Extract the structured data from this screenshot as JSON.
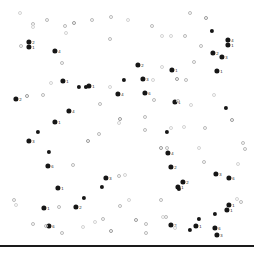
{
  "figure": {
    "title": "",
    "background_color": "#ffffff",
    "width": 254,
    "height": 254
  },
  "colors": {
    "filled_marker": "#161616",
    "hollow_marker": "#b9b9b9",
    "faint_marker": "#d3d3d3",
    "label_text": "#1d1d1d",
    "baseline": "#1a1a1a"
  },
  "baseline": {
    "name": "bottom-rule",
    "y": 245,
    "thickness": 1.6
  },
  "chart_data": {
    "type": "scatter",
    "title": "",
    "xlabel": "",
    "ylabel": "",
    "xlim": [
      0,
      254
    ],
    "ylim": [
      0,
      254
    ],
    "grid": false,
    "legend": null,
    "axes_visible": false,
    "series": [
      {
        "name": "labelled-points",
        "marker": "filled-circle",
        "color": "#161616",
        "points": [
          {
            "x": 29,
            "y": 42,
            "label": "2"
          },
          {
            "x": 29,
            "y": 47,
            "label": "1"
          },
          {
            "x": 55,
            "y": 51,
            "label": "4"
          },
          {
            "x": 63,
            "y": 81,
            "label": "1"
          },
          {
            "x": 79,
            "y": 87,
            "label": ""
          },
          {
            "x": 86,
            "y": 87,
            "label": ""
          },
          {
            "x": 89,
            "y": 86,
            "label": "1"
          },
          {
            "x": 16,
            "y": 99,
            "label": "2"
          },
          {
            "x": 118,
            "y": 94,
            "label": "4"
          },
          {
            "x": 69,
            "y": 111,
            "label": "4"
          },
          {
            "x": 55,
            "y": 122,
            "label": "1"
          },
          {
            "x": 138,
            "y": 65,
            "label": "2"
          },
          {
            "x": 124,
            "y": 80,
            "label": ""
          },
          {
            "x": 143,
            "y": 79,
            "label": "3"
          },
          {
            "x": 145,
            "y": 93,
            "label": "6"
          },
          {
            "x": 172,
            "y": 70,
            "label": "1"
          },
          {
            "x": 175,
            "y": 102,
            "label": "1"
          },
          {
            "x": 212,
            "y": 31,
            "label": ""
          },
          {
            "x": 228,
            "y": 40,
            "label": "4"
          },
          {
            "x": 228,
            "y": 45,
            "label": "1"
          },
          {
            "x": 213,
            "y": 53,
            "label": "2"
          },
          {
            "x": 222,
            "y": 57,
            "label": "3"
          },
          {
            "x": 217,
            "y": 71,
            "label": "1"
          },
          {
            "x": 226,
            "y": 108,
            "label": ""
          },
          {
            "x": 38,
            "y": 132,
            "label": ""
          },
          {
            "x": 29,
            "y": 141,
            "label": "3"
          },
          {
            "x": 49,
            "y": 152,
            "label": ""
          },
          {
            "x": 48,
            "y": 166,
            "label": "6"
          },
          {
            "x": 58,
            "y": 188,
            "label": "1"
          },
          {
            "x": 106,
            "y": 178,
            "label": "3"
          },
          {
            "x": 102,
            "y": 187,
            "label": ""
          },
          {
            "x": 44,
            "y": 208,
            "label": "1"
          },
          {
            "x": 76,
            "y": 207,
            "label": "2"
          },
          {
            "x": 84,
            "y": 198,
            "label": ""
          },
          {
            "x": 49,
            "y": 226,
            "label": "6"
          },
          {
            "x": 168,
            "y": 153,
            "label": "4"
          },
          {
            "x": 167,
            "y": 132,
            "label": ""
          },
          {
            "x": 183,
            "y": 182,
            "label": "2"
          },
          {
            "x": 216,
            "y": 174,
            "label": "3"
          },
          {
            "x": 229,
            "y": 178,
            "label": "6"
          },
          {
            "x": 171,
            "y": 167,
            "label": "2"
          },
          {
            "x": 178,
            "y": 187,
            "label": "1"
          },
          {
            "x": 179,
            "y": 189,
            "label": ""
          },
          {
            "x": 229,
            "y": 205,
            "label": "1"
          },
          {
            "x": 227,
            "y": 210,
            "label": "1"
          },
          {
            "x": 215,
            "y": 214,
            "label": ""
          },
          {
            "x": 199,
            "y": 219,
            "label": ""
          },
          {
            "x": 196,
            "y": 226,
            "label": "1"
          },
          {
            "x": 171,
            "y": 225,
            "label": "2"
          },
          {
            "x": 215,
            "y": 228,
            "label": "6"
          },
          {
            "x": 217,
            "y": 235,
            "label": "3"
          },
          {
            "x": 190,
            "y": 230,
            "label": ""
          }
        ]
      },
      {
        "name": "background-points",
        "marker": "open-circle",
        "color": "#b9b9b9",
        "points": [
          {
            "x": 20,
            "y": 13
          },
          {
            "x": 33,
            "y": 24
          },
          {
            "x": 47,
            "y": 20
          },
          {
            "x": 33,
            "y": 27
          },
          {
            "x": 65,
            "y": 26
          },
          {
            "x": 74,
            "y": 23
          },
          {
            "x": 66,
            "y": 33
          },
          {
            "x": 21,
            "y": 46
          },
          {
            "x": 62,
            "y": 63
          },
          {
            "x": 51,
            "y": 83
          },
          {
            "x": 27,
            "y": 96
          },
          {
            "x": 43,
            "y": 95
          },
          {
            "x": 110,
            "y": 87
          },
          {
            "x": 92,
            "y": 20
          },
          {
            "x": 111,
            "y": 17
          },
          {
            "x": 128,
            "y": 20
          },
          {
            "x": 110,
            "y": 39
          },
          {
            "x": 152,
            "y": 26
          },
          {
            "x": 162,
            "y": 36
          },
          {
            "x": 190,
            "y": 13
          },
          {
            "x": 206,
            "y": 18
          },
          {
            "x": 171,
            "y": 36
          },
          {
            "x": 185,
            "y": 36
          },
          {
            "x": 194,
            "y": 62
          },
          {
            "x": 162,
            "y": 67
          },
          {
            "x": 177,
            "y": 79
          },
          {
            "x": 186,
            "y": 80
          },
          {
            "x": 153,
            "y": 80
          },
          {
            "x": 154,
            "y": 100
          },
          {
            "x": 178,
            "y": 101
          },
          {
            "x": 191,
            "y": 105
          },
          {
            "x": 145,
            "y": 117
          },
          {
            "x": 145,
            "y": 130
          },
          {
            "x": 184,
            "y": 127
          },
          {
            "x": 100,
            "y": 104
          },
          {
            "x": 120,
            "y": 119
          },
          {
            "x": 119,
            "y": 123
          },
          {
            "x": 73,
            "y": 165
          },
          {
            "x": 119,
            "y": 176
          },
          {
            "x": 125,
            "y": 175
          },
          {
            "x": 161,
            "y": 148
          },
          {
            "x": 167,
            "y": 148
          },
          {
            "x": 199,
            "y": 148
          },
          {
            "x": 243,
            "y": 143
          },
          {
            "x": 245,
            "y": 149
          },
          {
            "x": 171,
            "y": 128
          },
          {
            "x": 205,
            "y": 128
          },
          {
            "x": 161,
            "y": 200
          },
          {
            "x": 129,
            "y": 200
          },
          {
            "x": 120,
            "y": 206
          },
          {
            "x": 136,
            "y": 220
          },
          {
            "x": 163,
            "y": 217
          },
          {
            "x": 166,
            "y": 217
          },
          {
            "x": 146,
            "y": 224
          },
          {
            "x": 95,
            "y": 222
          },
          {
            "x": 111,
            "y": 231
          },
          {
            "x": 146,
            "y": 233
          },
          {
            "x": 175,
            "y": 228
          },
          {
            "x": 46,
            "y": 226
          },
          {
            "x": 14,
            "y": 200
          },
          {
            "x": 16,
            "y": 205
          },
          {
            "x": 33,
            "y": 224
          },
          {
            "x": 62,
            "y": 233
          },
          {
            "x": 83,
            "y": 227
          },
          {
            "x": 103,
            "y": 219
          },
          {
            "x": 88,
            "y": 141
          },
          {
            "x": 237,
            "y": 199
          },
          {
            "x": 241,
            "y": 202
          },
          {
            "x": 204,
            "y": 162
          },
          {
            "x": 238,
            "y": 164
          },
          {
            "x": 232,
            "y": 120
          },
          {
            "x": 99,
            "y": 134
          },
          {
            "x": 214,
            "y": 95
          },
          {
            "x": 201,
            "y": 46
          },
          {
            "x": 59,
            "y": 207
          }
        ]
      }
    ]
  }
}
